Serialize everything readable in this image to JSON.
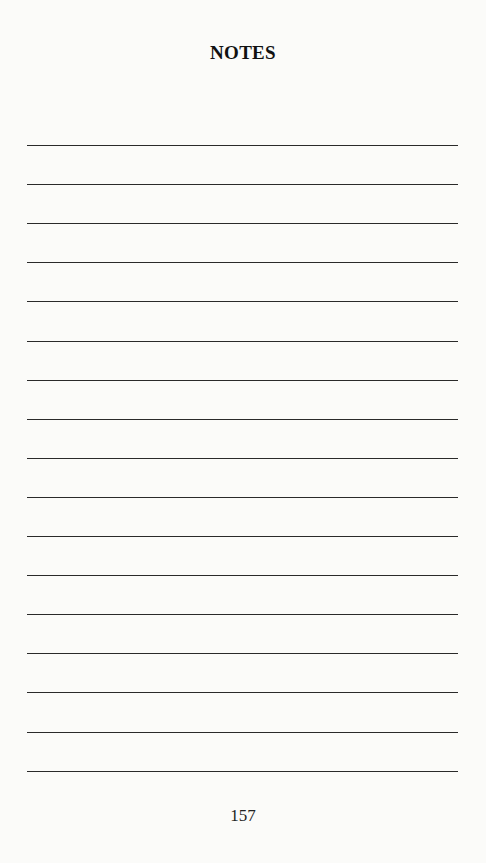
{
  "page": {
    "title": "NOTES",
    "page_number": "157",
    "rule_count": 17
  }
}
